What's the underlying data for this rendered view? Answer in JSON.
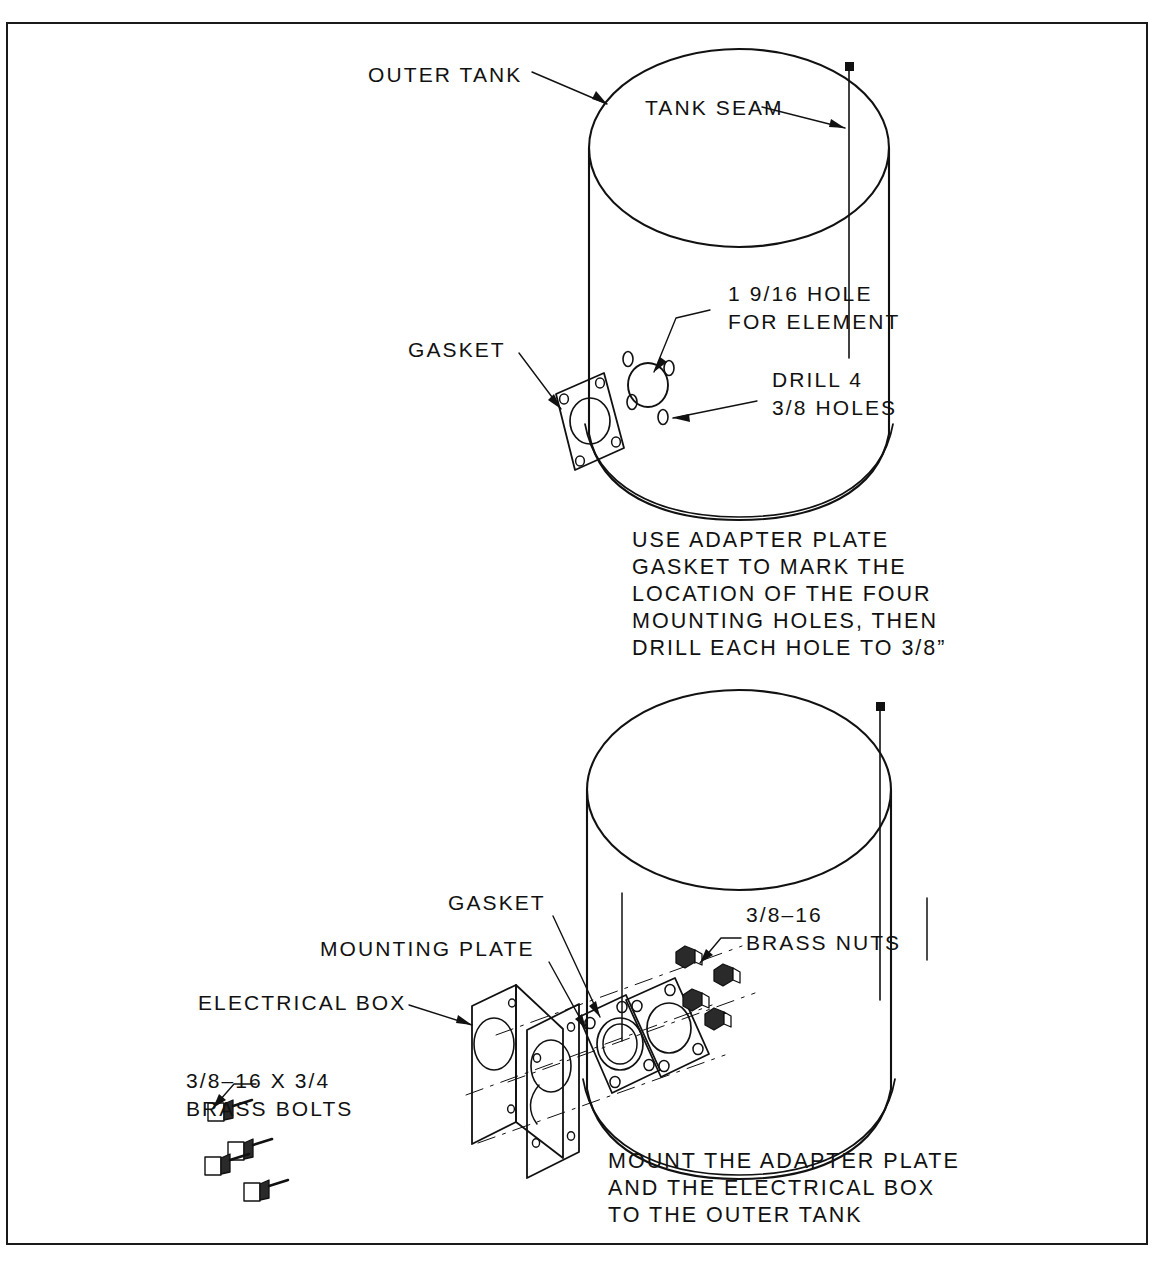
{
  "drawing": {
    "title": "Outer tank adapter plate and electrical box mounting instructions",
    "line_color": "#111111",
    "background_color": "#ffffff"
  },
  "upper_view": {
    "labels": {
      "outer_tank": "OUTER TANK",
      "tank_seam": "TANK SEAM",
      "element_hole_line1": "1 9/16 HOLE",
      "element_hole_line2": "FOR ELEMENT",
      "drill_holes_line1": "DRILL 4",
      "drill_holes_line2": "3/8 HOLES",
      "gasket": "GASKET"
    },
    "instruction": {
      "line1": "USE ADAPTER PLATE",
      "line2": "GASKET TO MARK THE",
      "line3": "LOCATION OF THE FOUR",
      "line4": "MOUNTING HOLES, THEN",
      "line5": "DRILL EACH HOLE TO 3/8”"
    }
  },
  "lower_view": {
    "labels": {
      "gasket": "GASKET",
      "mounting_plate": "MOUNTING PLATE",
      "electrical_box": "ELECTRICAL BOX",
      "brass_nuts_line1": "3/8–16",
      "brass_nuts_line2": "BRASS NUTS",
      "brass_bolts_line1": "3/8–16 X 3/4",
      "brass_bolts_line2": "BRASS BOLTS"
    },
    "instruction": {
      "line1": "MOUNT THE ADAPTER PLATE",
      "line2": "AND THE ELECTRICAL BOX",
      "line3": "TO THE OUTER TANK"
    }
  }
}
